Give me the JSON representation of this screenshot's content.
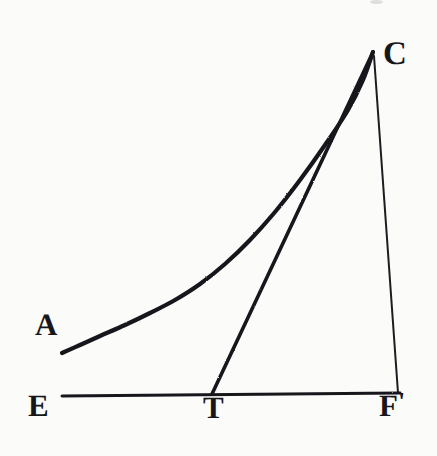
{
  "figure": {
    "background_color": "#fbfbf9",
    "ink_color": "#17161a",
    "width": 437,
    "height": 456
  },
  "labels": {
    "a": "A",
    "c": "C",
    "e": "E",
    "t": "T",
    "f": "F",
    "f_prime_mark": "'"
  },
  "chart_data": {
    "type": "line",
    "xlabel": "",
    "ylabel": "",
    "grid": false,
    "legend": null,
    "axis_ranges": {
      "x_pixels": [
        0,
        437
      ],
      "y_pixels": [
        0,
        456
      ]
    },
    "points": {
      "A": [
        62,
        353
      ],
      "C": [
        373,
        52
      ],
      "E": [
        62,
        395
      ],
      "T": [
        212,
        394
      ],
      "F": [
        398,
        393
      ]
    },
    "series": [
      {
        "name": "curve-AC",
        "stroke_width": 4.2,
        "kind": "curve",
        "values": [
          [
            62,
            353
          ],
          [
            80,
            345
          ],
          [
            100,
            336
          ],
          [
            125,
            325
          ],
          [
            150,
            313
          ],
          [
            175,
            300
          ],
          [
            200,
            284
          ],
          [
            225,
            264
          ],
          [
            250,
            240
          ],
          [
            275,
            212
          ],
          [
            300,
            180
          ],
          [
            325,
            145
          ],
          [
            348,
            110
          ],
          [
            363,
            80
          ],
          [
            373,
            52
          ]
        ]
      },
      {
        "name": "tangent-TC",
        "stroke_width": 3.6,
        "kind": "straight",
        "values": [
          [
            212,
            394
          ],
          [
            373,
            52
          ]
        ]
      },
      {
        "name": "ordinate-CF",
        "stroke_width": 2.0,
        "kind": "straight",
        "values": [
          [
            374,
            56
          ],
          [
            398,
            393
          ]
        ]
      },
      {
        "name": "baseline-EF",
        "stroke_width": 3.0,
        "kind": "straight",
        "values": [
          [
            62,
            396
          ],
          [
            400,
            393
          ]
        ]
      }
    ]
  }
}
